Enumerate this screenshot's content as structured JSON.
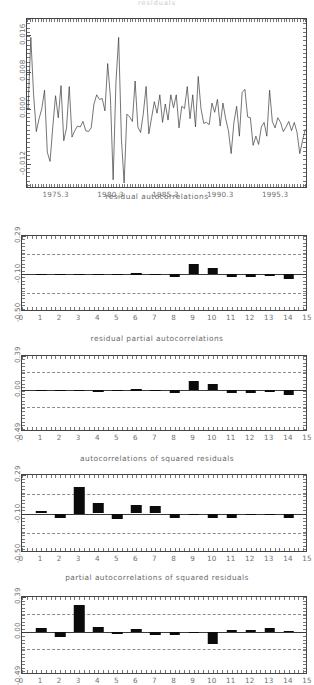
{
  "figure": {
    "top_title": "residuals",
    "background": "#ffffff",
    "bar_color": "#0b0b0b",
    "axis_color": "#444444",
    "conf_color": "#8c8c8c",
    "text_color": "#6a6a6a"
  },
  "chart_data": [
    {
      "id": "residual-series",
      "type": "line",
      "title": "",
      "caption": "residual autocorrelations",
      "xlabel": "",
      "ylabel": "",
      "xlim": [
        1972.6,
        1998.2
      ],
      "ylim": [
        -0.0175,
        0.0195
      ],
      "yticks": [
        0.016,
        0.008,
        0.0,
        -0.012
      ],
      "ytick_labels": [
        "0.016",
        "0.008",
        "0.000",
        "-0.012"
      ],
      "xticks": [
        1975.3,
        1980.3,
        1985.3,
        1990.3,
        1995.3
      ],
      "xtick_labels": [
        "1975.3",
        "1980.3",
        "1985.3",
        "1990.3",
        "1995.3"
      ],
      "grid": false,
      "x": [
        1972.7,
        1972.95,
        1973.2,
        1973.45,
        1973.7,
        1973.95,
        1974.2,
        1974.45,
        1974.7,
        1974.95,
        1975.2,
        1975.45,
        1975.7,
        1975.95,
        1976.2,
        1976.45,
        1976.7,
        1976.95,
        1977.2,
        1977.45,
        1977.7,
        1977.95,
        1978.2,
        1978.45,
        1978.7,
        1978.95,
        1979.2,
        1979.45,
        1979.7,
        1979.95,
        1980.2,
        1980.45,
        1980.7,
        1980.95,
        1981.2,
        1981.45,
        1981.7,
        1981.95,
        1982.2,
        1982.45,
        1982.7,
        1982.95,
        1983.2,
        1983.45,
        1983.7,
        1983.95,
        1984.2,
        1984.45,
        1984.7,
        1984.95,
        1985.2,
        1985.45,
        1985.7,
        1985.95,
        1986.2,
        1986.45,
        1986.7,
        1986.95,
        1987.2,
        1987.45,
        1987.7,
        1987.95,
        1988.2,
        1988.45,
        1988.7,
        1988.95,
        1989.2,
        1989.45,
        1989.7,
        1989.95,
        1990.2,
        1990.45,
        1990.7,
        1990.95,
        1991.2,
        1991.45,
        1991.7,
        1991.95,
        1992.2,
        1992.45,
        1992.7,
        1992.95,
        1993.2,
        1993.45,
        1993.7,
        1993.95,
        1994.2,
        1994.45,
        1994.7,
        1994.95,
        1995.2,
        1995.45,
        1995.7,
        1995.95,
        1996.2,
        1996.45,
        1996.7,
        1996.95,
        1997.2,
        1997.45,
        1997.7,
        1997.95
      ],
      "y": [
        0.0,
        0.0155,
        0.003,
        -0.005,
        -0.0022,
        0.0,
        0.004,
        -0.0095,
        -0.0115,
        -0.004,
        0.0028,
        -0.002,
        0.005,
        -0.007,
        -0.0042,
        0.0048,
        -0.0062,
        -0.0048,
        -0.0038,
        -0.004,
        -0.0028,
        -0.0048,
        -0.005,
        -0.0042,
        0.001,
        0.003,
        0.002,
        0.0022,
        -0.0005,
        0.0098,
        0.0025,
        -0.0155,
        0.0055,
        0.0155,
        -0.0065,
        -0.0162,
        -0.0012,
        -0.0018,
        -0.0028,
        0.006,
        -0.004,
        -0.0052,
        -0.001,
        0.0048,
        -0.0055,
        -0.002,
        0.0015,
        -0.001,
        0.003,
        -0.003,
        0.001,
        -0.0025,
        0.003,
        0.0002,
        0.003,
        -0.0042,
        0.0005,
        0.0,
        0.0048,
        -0.0022,
        0.003,
        -0.004,
        0.007,
        0.0,
        -0.0032,
        -0.003,
        -0.0035,
        0.0012,
        -0.0008,
        0.002,
        -0.0038,
        0.0012,
        -0.0022,
        -0.0048,
        -0.0098,
        -0.003,
        0.0005,
        -0.006,
        0.0035,
        0.0042,
        -0.0018,
        -0.002,
        -0.008,
        -0.006,
        -0.0078,
        -0.004,
        -0.003,
        -0.006,
        0.004,
        -0.0028,
        -0.0042,
        -0.002,
        -0.003,
        -0.005,
        -0.004,
        -0.0028,
        -0.0048,
        -0.003,
        -0.0052,
        -0.0098,
        -0.007,
        -0.0045
      ]
    },
    {
      "id": "residual-autocorrelations",
      "type": "bar",
      "title": "residual autocorrelations",
      "caption": "residual partial autocorrelations",
      "xlabel": "",
      "ylabel": "",
      "xlim": [
        0,
        15
      ],
      "ylim": [
        -0.5,
        0.29
      ],
      "yticks": [
        0.29,
        -0.1,
        -0.5
      ],
      "ytick_labels": [
        "0.29",
        "-0.10",
        "-0.50"
      ],
      "xticks": [
        0,
        1,
        2,
        3,
        4,
        5,
        6,
        7,
        8,
        9,
        10,
        11,
        12,
        13,
        14,
        15
      ],
      "xtick_labels": [
        "0",
        "1",
        "2",
        "3",
        "4",
        "5",
        "6",
        "7",
        "8",
        "9",
        "10",
        "11",
        "12",
        "13",
        "14",
        "15"
      ],
      "zero_level": -0.1,
      "conf_levels": [
        0.1,
        -0.3
      ],
      "grid": false,
      "lags": [
        1,
        2,
        3,
        4,
        5,
        6,
        7,
        8,
        9,
        10,
        11,
        12,
        13,
        14
      ],
      "values": [
        0.0,
        -0.018,
        -0.005,
        -0.018,
        -0.017,
        0.003,
        -0.007,
        -0.032,
        0.095,
        0.058,
        -0.034,
        -0.036,
        -0.022,
        -0.055
      ]
    },
    {
      "id": "residual-partial-autocorrelations",
      "type": "bar",
      "title": "residual partial autocorrelations",
      "caption": "autocorrelations of squared residuals",
      "xlabel": "",
      "ylabel": "",
      "xlim": [
        0,
        15
      ],
      "ylim": [
        -0.49,
        0.39
      ],
      "yticks": [
        0.39,
        0.0,
        -0.49
      ],
      "ytick_labels": [
        "0.39",
        "0.00",
        "-0.49"
      ],
      "xticks": [
        0,
        1,
        2,
        3,
        4,
        5,
        6,
        7,
        8,
        9,
        10,
        11,
        12,
        13,
        14,
        15
      ],
      "xtick_labels": [
        "0",
        "1",
        "2",
        "3",
        "4",
        "5",
        "6",
        "7",
        "8",
        "9",
        "10",
        "11",
        "12",
        "13",
        "14",
        "15"
      ],
      "zero_level": 0.0,
      "conf_levels": [
        0.2,
        -0.2
      ],
      "grid": false,
      "lags": [
        1,
        2,
        3,
        4,
        5,
        6,
        7,
        8,
        9,
        10,
        11,
        12,
        13,
        14
      ],
      "values": [
        0.0,
        -0.02,
        -0.008,
        -0.022,
        -0.02,
        0.004,
        -0.008,
        -0.038,
        0.105,
        0.062,
        -0.038,
        -0.042,
        -0.024,
        -0.06
      ]
    },
    {
      "id": "autocorrelations-squared-residuals",
      "type": "bar",
      "title": "autocorrelations of squared residuals",
      "caption": "partial autocorrelations of squared residuals",
      "xlabel": "",
      "ylabel": "",
      "xlim": [
        0,
        15
      ],
      "ylim": [
        -0.5,
        0.29
      ],
      "yticks": [
        0.29,
        -0.1,
        -0.5
      ],
      "ytick_labels": [
        "0.29",
        "-0.10",
        "-0.50"
      ],
      "xticks": [
        0,
        1,
        2,
        3,
        4,
        5,
        6,
        7,
        8,
        9,
        10,
        11,
        12,
        13,
        14,
        15
      ],
      "xtick_labels": [
        "0",
        "1",
        "2",
        "3",
        "4",
        "5",
        "6",
        "7",
        "8",
        "9",
        "10",
        "11",
        "12",
        "13",
        "14",
        "15"
      ],
      "zero_level": -0.1,
      "conf_levels": [
        0.1,
        -0.3
      ],
      "grid": false,
      "lags": [
        1,
        2,
        3,
        4,
        5,
        6,
        7,
        8,
        9,
        10,
        11,
        12,
        13,
        14
      ],
      "values": [
        0.03,
        -0.045,
        0.27,
        0.105,
        -0.055,
        0.09,
        0.08,
        -0.05,
        -0.005,
        -0.05,
        -0.045,
        -0.012,
        -0.02,
        -0.048
      ]
    },
    {
      "id": "partial-autocorrelations-squared-residuals",
      "type": "bar",
      "title": "partial autocorrelations of squared residuals",
      "caption": "",
      "xlabel": "",
      "ylabel": "",
      "xlim": [
        0,
        15
      ],
      "ylim": [
        -0.49,
        0.39
      ],
      "yticks": [
        0.39,
        0.0,
        -0.49
      ],
      "ytick_labels": [
        "0.39",
        "0.00",
        "-0.49"
      ],
      "xticks": [
        0,
        1,
        2,
        3,
        4,
        5,
        6,
        7,
        8,
        9,
        10,
        11,
        12,
        13,
        14,
        15
      ],
      "xtick_labels": [
        "0",
        "1",
        "2",
        "3",
        "4",
        "5",
        "6",
        "7",
        "8",
        "9",
        "10",
        "11",
        "12",
        "13",
        "14",
        "15"
      ],
      "zero_level": 0.0,
      "conf_levels": [
        0.2,
        -0.2
      ],
      "grid": false,
      "lags": [
        1,
        2,
        3,
        4,
        5,
        6,
        7,
        8,
        9,
        10,
        11,
        12,
        13,
        14
      ],
      "values": [
        0.035,
        -0.065,
        0.3,
        0.055,
        -0.03,
        0.03,
        -0.035,
        -0.035,
        -0.01,
        -0.135,
        0.02,
        0.022,
        0.042,
        0.012
      ]
    }
  ]
}
